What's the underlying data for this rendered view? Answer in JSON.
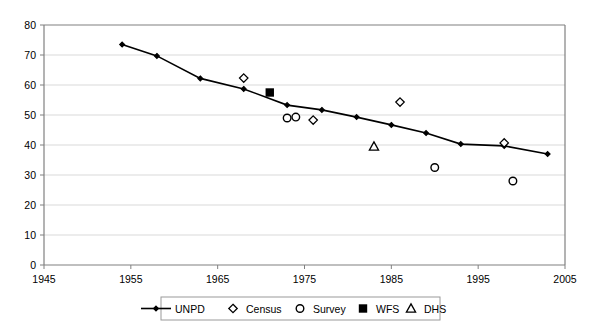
{
  "chart_data": {
    "type": "line",
    "title": "",
    "subtitle": "",
    "xlabel": "",
    "ylabel": "",
    "xlim": [
      1945,
      2005
    ],
    "ylim": [
      0,
      80
    ],
    "xticks": [
      1945,
      1955,
      1965,
      1975,
      1985,
      1995,
      2005
    ],
    "yticks": [
      0,
      10,
      20,
      30,
      40,
      50,
      60,
      70,
      80
    ],
    "grid": "horizontal",
    "legend_position": "bottom",
    "series": [
      {
        "name": "UNPD",
        "marker": "line-with-small-diamond",
        "type": "line",
        "points": [
          {
            "x": 1954,
            "y": 73.5
          },
          {
            "x": 1958,
            "y": 69.7
          },
          {
            "x": 1963,
            "y": 62.2
          },
          {
            "x": 1968,
            "y": 58.7
          },
          {
            "x": 1973,
            "y": 53.3
          },
          {
            "x": 1977,
            "y": 51.7
          },
          {
            "x": 1981,
            "y": 49.3
          },
          {
            "x": 1985,
            "y": 46.7
          },
          {
            "x": 1989,
            "y": 44.0
          },
          {
            "x": 1993,
            "y": 40.3
          },
          {
            "x": 1998,
            "y": 39.7
          },
          {
            "x": 2003,
            "y": 37.0
          }
        ]
      },
      {
        "name": "Census",
        "marker": "open-diamond",
        "type": "scatter",
        "points": [
          {
            "x": 1968,
            "y": 62.3
          },
          {
            "x": 1976,
            "y": 48.3
          },
          {
            "x": 1986,
            "y": 54.3
          },
          {
            "x": 1998,
            "y": 40.7
          }
        ]
      },
      {
        "name": "Survey",
        "marker": "open-circle",
        "type": "scatter",
        "points": [
          {
            "x": 1973,
            "y": 49.0
          },
          {
            "x": 1974,
            "y": 49.3
          },
          {
            "x": 1990,
            "y": 32.5
          },
          {
            "x": 1999,
            "y": 28.0
          }
        ]
      },
      {
        "name": "WFS",
        "marker": "filled-square",
        "type": "scatter",
        "points": [
          {
            "x": 1971,
            "y": 57.5
          }
        ]
      },
      {
        "name": "DHS",
        "marker": "open-triangle",
        "type": "scatter",
        "points": [
          {
            "x": 1983,
            "y": 39.5
          }
        ]
      }
    ],
    "legend": [
      {
        "label": "UNPD",
        "marker": "line-with-small-diamond"
      },
      {
        "label": "Census",
        "marker": "open-diamond"
      },
      {
        "label": "Survey",
        "marker": "open-circle"
      },
      {
        "label": "WFS",
        "marker": "filled-square"
      },
      {
        "label": "DHS",
        "marker": "open-triangle"
      }
    ],
    "colors": {
      "series": "#000000",
      "grid": "#d9d9d9",
      "axis": "#808080",
      "background": "#ffffff"
    }
  }
}
